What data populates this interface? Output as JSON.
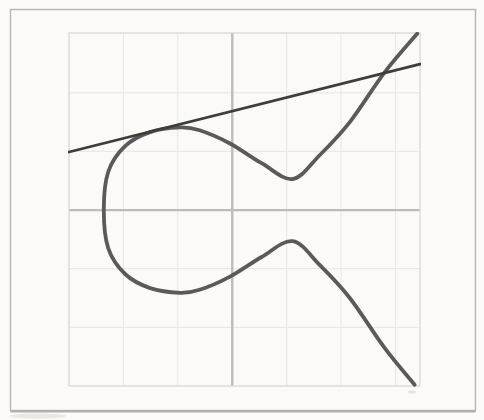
{
  "canvas": {
    "background": "#fbfaf7",
    "outer_border_color": "#b4b4b4",
    "outer_border_shadow_color": "#a0a09c",
    "plot_border_color": "#d8d8d8",
    "grid_color": "#e9e9e9",
    "smudge_color": "#d8d5cd"
  },
  "chart_data": {
    "type": "line",
    "title": "",
    "xlabel": "",
    "ylabel": "",
    "xlim": [
      -3,
      3.45
    ],
    "ylim": [
      -3,
      3.02
    ],
    "grid": true,
    "grid_step": 1,
    "legend": "none",
    "axes": {
      "x_axis_y": 0,
      "y_axis_x": 0,
      "color": "#bcbcbc",
      "width": 2.4
    },
    "series": [
      {
        "name": "elliptic-curve",
        "color": "#5a5a5a",
        "width": 3.8,
        "smooth": true,
        "points": [
          [
            3.4,
            3.01
          ],
          [
            2.8,
            2.35
          ],
          [
            2.16,
            1.5
          ],
          [
            1.61,
            0.94
          ],
          [
            1.11,
            0.53
          ],
          [
            0.54,
            0.8
          ],
          [
            -0.05,
            1.14
          ],
          [
            -0.6,
            1.36
          ],
          [
            -0.96,
            1.41
          ],
          [
            -1.51,
            1.33
          ],
          [
            -1.97,
            1.09
          ],
          [
            -2.28,
            0.65
          ],
          [
            -2.36,
            0.0
          ],
          [
            -2.28,
            -0.65
          ],
          [
            -1.97,
            -1.09
          ],
          [
            -1.51,
            -1.33
          ],
          [
            -0.96,
            -1.41
          ],
          [
            -0.6,
            -1.36
          ],
          [
            -0.05,
            -1.14
          ],
          [
            0.54,
            -0.8
          ],
          [
            1.11,
            -0.53
          ],
          [
            1.61,
            -0.94
          ],
          [
            2.16,
            -1.5
          ],
          [
            2.8,
            -2.35
          ],
          [
            3.35,
            -2.98
          ]
        ]
      },
      {
        "name": "tangent-line",
        "color": "#3d3d3d",
        "width": 2.8,
        "smooth": false,
        "points": [
          [
            -3.0,
            0.99
          ],
          [
            3.45,
            2.49
          ]
        ]
      }
    ]
  }
}
